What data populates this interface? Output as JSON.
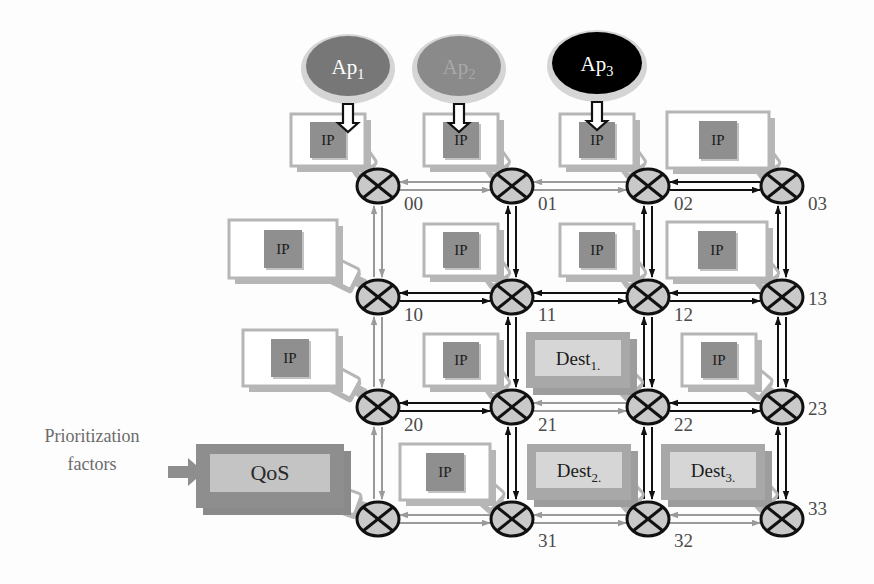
{
  "diagram": {
    "colors": {
      "black": "#111111",
      "gray_link": "#9a9a9a",
      "router_fill": "#c9c9c9",
      "ip_inner": "#8f8f8f",
      "box_white": "#ffffff",
      "shadow": "#b6b6b6",
      "dest_fill": "#a8a8a8",
      "dest_inner": "#d6d6d6",
      "qos_outer": "#8e8e8e",
      "qos_inner": "#c4c4c4",
      "ap1_fill": "#777777",
      "ap2_fill": "#8a8a8a",
      "ap3_fill": "#000000",
      "label_text": "#4a4a4a"
    },
    "applications": [
      {
        "id": "ap1",
        "label": "Ap",
        "subscript": "1",
        "fill": "#777777",
        "text_color": "#ffffff",
        "cx": 348,
        "cy": 66,
        "rx": 42,
        "ry": 30,
        "arrow_x": 348
      },
      {
        "id": "ap2",
        "label": "Ap",
        "subscript": "2",
        "fill": "#8a8a8a",
        "text_color": "#a8a8a8",
        "cx": 459,
        "cy": 66,
        "rx": 42,
        "ry": 30,
        "arrow_x": 459
      },
      {
        "id": "ap3",
        "label": "Ap",
        "subscript": "3",
        "fill": "#000000",
        "text_color": "#ffffff",
        "cx": 597,
        "cy": 63,
        "rx": 45,
        "ry": 31,
        "arrow_x": 597
      }
    ],
    "routers": [
      {
        "id": "r00",
        "label": "00",
        "cx": 378,
        "cy": 186,
        "lx": 404,
        "ly": 210
      },
      {
        "id": "r01",
        "label": "01",
        "cx": 512,
        "cy": 186,
        "lx": 538,
        "ly": 210
      },
      {
        "id": "r02",
        "label": "02",
        "cx": 648,
        "cy": 186,
        "lx": 674,
        "ly": 210
      },
      {
        "id": "r03",
        "label": "03",
        "cx": 782,
        "cy": 186,
        "lx": 808,
        "ly": 210
      },
      {
        "id": "r10",
        "label": "10",
        "cx": 378,
        "cy": 297,
        "lx": 404,
        "ly": 321
      },
      {
        "id": "r11",
        "label": "11",
        "cx": 512,
        "cy": 297,
        "lx": 538,
        "ly": 321
      },
      {
        "id": "r12",
        "label": "12",
        "cx": 648,
        "cy": 297,
        "lx": 674,
        "ly": 321
      },
      {
        "id": "r13",
        "label": "13",
        "cx": 782,
        "cy": 297,
        "lx": 808,
        "ly": 305
      },
      {
        "id": "r20",
        "label": "20",
        "cx": 378,
        "cy": 407,
        "lx": 404,
        "ly": 431
      },
      {
        "id": "r21",
        "label": "21",
        "cx": 512,
        "cy": 407,
        "lx": 538,
        "ly": 431
      },
      {
        "id": "r22",
        "label": "22",
        "cx": 648,
        "cy": 407,
        "lx": 674,
        "ly": 431
      },
      {
        "id": "r23",
        "label": "23",
        "cx": 782,
        "cy": 407,
        "lx": 808,
        "ly": 415
      },
      {
        "id": "r30",
        "label": "",
        "cx": 378,
        "cy": 519,
        "lx": 404,
        "ly": 543
      },
      {
        "id": "r31",
        "label": "31",
        "cx": 512,
        "cy": 519,
        "lx": 538,
        "ly": 547
      },
      {
        "id": "r32",
        "label": "32",
        "cx": 648,
        "cy": 519,
        "lx": 674,
        "ly": 547
      },
      {
        "id": "r33",
        "label": "33",
        "cx": 782,
        "cy": 519,
        "lx": 808,
        "ly": 515
      }
    ],
    "tiles": [
      {
        "id": "t00",
        "kind": "ip",
        "label": "IP",
        "x": 291,
        "y": 114,
        "w": 74,
        "h": 52
      },
      {
        "id": "t01",
        "kind": "ip",
        "label": "IP",
        "x": 424,
        "y": 114,
        "w": 74,
        "h": 52
      },
      {
        "id": "t02",
        "kind": "ip",
        "label": "IP",
        "x": 560,
        "y": 114,
        "w": 74,
        "h": 52
      },
      {
        "id": "t03",
        "kind": "ip",
        "label": "IP",
        "x": 667,
        "y": 112,
        "w": 102,
        "h": 56
      },
      {
        "id": "t10",
        "kind": "ip",
        "label": "IP",
        "x": 229,
        "y": 220,
        "w": 108,
        "h": 58
      },
      {
        "id": "t11",
        "kind": "ip",
        "label": "IP",
        "x": 424,
        "y": 224,
        "w": 74,
        "h": 52
      },
      {
        "id": "t12",
        "kind": "ip",
        "label": "IP",
        "x": 560,
        "y": 224,
        "w": 74,
        "h": 52
      },
      {
        "id": "t13",
        "kind": "ip",
        "label": "IP",
        "x": 667,
        "y": 222,
        "w": 100,
        "h": 56
      },
      {
        "id": "t20",
        "kind": "ip",
        "label": "IP",
        "x": 243,
        "y": 330,
        "w": 94,
        "h": 56
      },
      {
        "id": "t21",
        "kind": "ip",
        "label": "IP",
        "x": 424,
        "y": 334,
        "w": 74,
        "h": 52
      },
      {
        "id": "t22",
        "kind": "dest",
        "label": "Dest",
        "subscript": "1",
        "x": 526,
        "y": 332,
        "w": 104,
        "h": 56
      },
      {
        "id": "t23",
        "kind": "ip",
        "label": "IP",
        "x": 682,
        "y": 334,
        "w": 74,
        "h": 52
      },
      {
        "id": "t30",
        "kind": "qos",
        "label": "QoS",
        "x": 196,
        "y": 444,
        "w": 148,
        "h": 64
      },
      {
        "id": "t31",
        "kind": "ip",
        "label": "IP",
        "x": 400,
        "y": 444,
        "w": 90,
        "h": 56
      },
      {
        "id": "t32",
        "kind": "dest",
        "label": "Dest",
        "subscript": "2",
        "x": 527,
        "y": 444,
        "w": 104,
        "h": 56
      },
      {
        "id": "t33",
        "kind": "dest",
        "label": "Dest",
        "subscript": "3",
        "x": 661,
        "y": 444,
        "w": 104,
        "h": 56
      }
    ],
    "horizontal_links": [
      {
        "id": "h00-01",
        "row": 0,
        "x1": 378,
        "x2": 512,
        "y": 186,
        "style": "gray"
      },
      {
        "id": "h01-02",
        "row": 0,
        "x1": 512,
        "x2": 648,
        "y": 186,
        "style": "gray"
      },
      {
        "id": "h02-03",
        "row": 0,
        "x1": 648,
        "x2": 782,
        "y": 186,
        "style": "black"
      },
      {
        "id": "h10-11",
        "row": 1,
        "x1": 378,
        "x2": 512,
        "y": 297,
        "style": "black"
      },
      {
        "id": "h11-12",
        "row": 1,
        "x1": 512,
        "x2": 648,
        "y": 297,
        "style": "black"
      },
      {
        "id": "h12-13",
        "row": 1,
        "x1": 648,
        "x2": 782,
        "y": 297,
        "style": "black"
      },
      {
        "id": "h20-21",
        "row": 2,
        "x1": 378,
        "x2": 512,
        "y": 407,
        "style": "black"
      },
      {
        "id": "h21-22",
        "row": 2,
        "x1": 512,
        "x2": 648,
        "y": 407,
        "style": "gray"
      },
      {
        "id": "h22-23",
        "row": 2,
        "x1": 648,
        "x2": 782,
        "y": 407,
        "style": "black"
      },
      {
        "id": "h30-31",
        "row": 3,
        "x1": 378,
        "x2": 512,
        "y": 519,
        "style": "gray"
      },
      {
        "id": "h31-32",
        "row": 3,
        "x1": 512,
        "x2": 648,
        "y": 519,
        "style": "gray"
      },
      {
        "id": "h32-33",
        "row": 3,
        "x1": 648,
        "x2": 782,
        "y": 519,
        "style": "gray"
      }
    ],
    "vertical_links": [
      {
        "id": "v00-10",
        "col": 0,
        "x": 378,
        "y1": 186,
        "y2": 297,
        "style": "gray"
      },
      {
        "id": "v10-20",
        "col": 0,
        "x": 378,
        "y1": 297,
        "y2": 407,
        "style": "gray"
      },
      {
        "id": "v20-30",
        "col": 0,
        "x": 378,
        "y1": 407,
        "y2": 519,
        "style": "gray"
      },
      {
        "id": "v01-11",
        "col": 1,
        "x": 512,
        "y1": 186,
        "y2": 297,
        "style": "black"
      },
      {
        "id": "v11-21",
        "col": 1,
        "x": 512,
        "y1": 297,
        "y2": 407,
        "style": "black"
      },
      {
        "id": "v21-31",
        "col": 1,
        "x": 512,
        "y1": 407,
        "y2": 519,
        "style": "black"
      },
      {
        "id": "v02-12",
        "col": 2,
        "x": 648,
        "y1": 186,
        "y2": 297,
        "style": "black"
      },
      {
        "id": "v12-22",
        "col": 2,
        "x": 648,
        "y1": 297,
        "y2": 407,
        "style": "black"
      },
      {
        "id": "v22-32",
        "col": 2,
        "x": 648,
        "y1": 407,
        "y2": 519,
        "style": "black"
      },
      {
        "id": "v03-13",
        "col": 3,
        "x": 782,
        "y1": 186,
        "y2": 297,
        "style": "black"
      },
      {
        "id": "v13-23",
        "col": 3,
        "x": 782,
        "y1": 297,
        "y2": 407,
        "style": "black"
      },
      {
        "id": "v23-33",
        "col": 3,
        "x": 782,
        "y1": 407,
        "y2": 519,
        "style": "black"
      }
    ],
    "annotations": {
      "prioritization_line1": "Prioritization",
      "prioritization_line2": "factors",
      "prioritization_x": 92,
      "prioritization_y1": 442,
      "prioritization_y2": 470
    }
  }
}
